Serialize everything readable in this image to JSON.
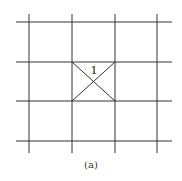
{
  "diagram": {
    "cell_label": "1",
    "caption": "(a)",
    "line_color": "#333333",
    "vertical_lines_x": [
      29,
      72,
      115,
      157
    ],
    "horizontal_lines_y": [
      22,
      62,
      101,
      141
    ],
    "grid_extent": {
      "x1": 16,
      "x2": 172,
      "y1": 14,
      "y2": 153
    },
    "highlighted_cell": {
      "x1": 72,
      "y1": 62,
      "x2": 115,
      "y2": 101,
      "diagonals": true
    }
  }
}
